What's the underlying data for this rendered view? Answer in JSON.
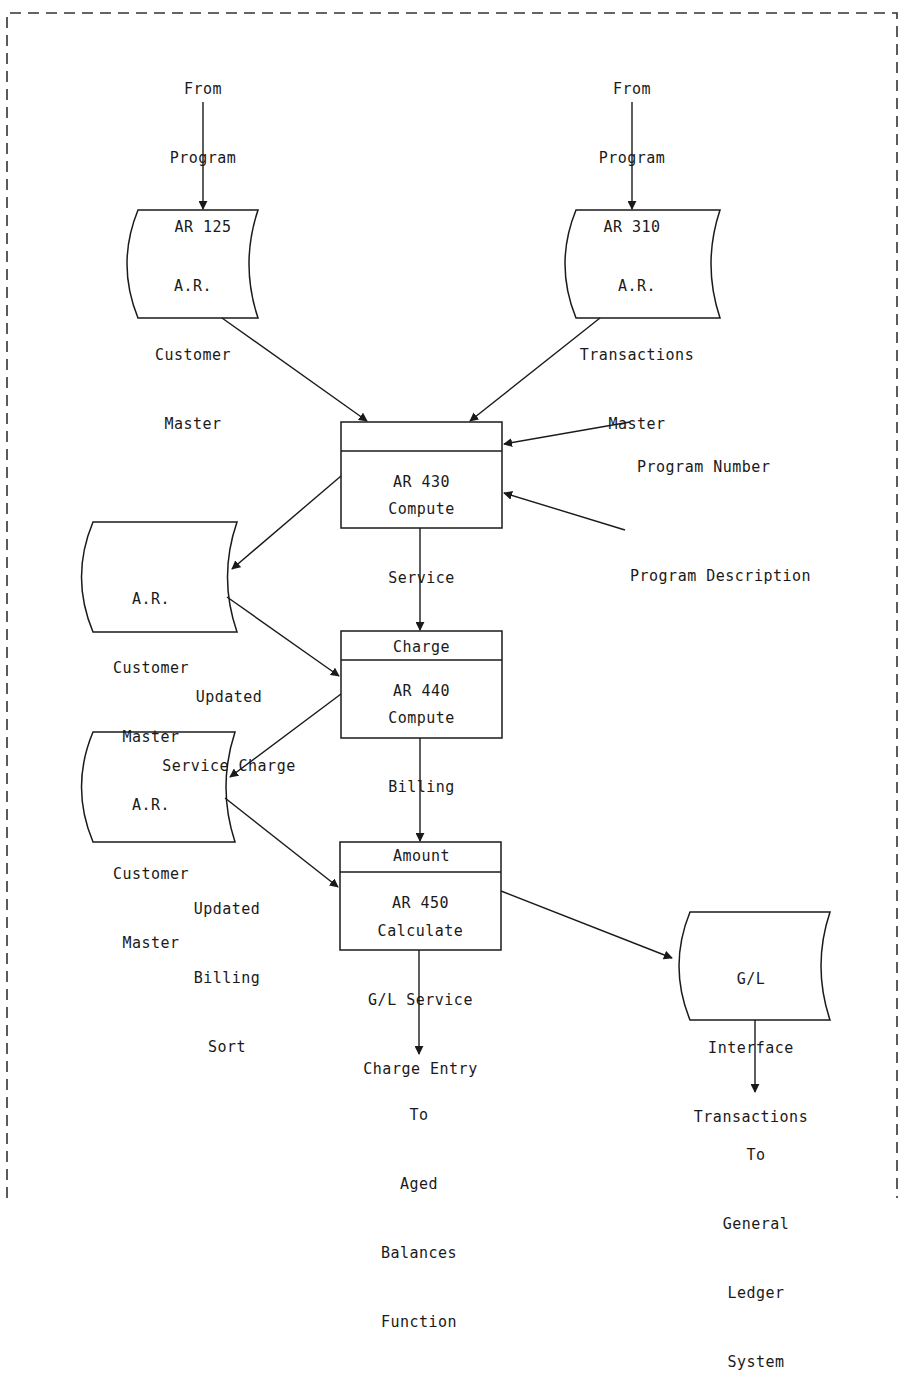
{
  "diagram": {
    "frame": {
      "style": "dashed"
    },
    "sources": {
      "ar125": {
        "lines": [
          "From",
          "Program",
          "AR 125"
        ]
      },
      "ar310": {
        "lines": [
          "From",
          "Program",
          "AR 310"
        ]
      }
    },
    "storage": {
      "customer_master_1": {
        "lines": [
          "A.R.",
          "Customer",
          "Master"
        ]
      },
      "transactions_master": {
        "lines": [
          "A.R.",
          "Transactions",
          "Master"
        ]
      },
      "customer_master_2": {
        "lines": [
          "A.R.",
          "Customer",
          "Master"
        ]
      },
      "customer_master_3": {
        "lines": [
          "A.R.",
          "Customer",
          "Master"
        ]
      },
      "gl_interface": {
        "lines": [
          "G/L",
          "Interface",
          "Transactions"
        ]
      }
    },
    "processes": {
      "ar430": {
        "number": "AR 430",
        "lines": [
          "Compute",
          "Service",
          "Charge"
        ]
      },
      "ar440": {
        "number": "AR 440",
        "lines": [
          "Compute",
          "Billing",
          "Amount"
        ]
      },
      "ar450": {
        "number": "AR 450",
        "lines": [
          "Calculate",
          "G/L Service",
          "Charge Entry"
        ]
      }
    },
    "annotations": {
      "program_number": "Program Number",
      "program_description": "Program Description",
      "updated_service_charge": [
        "Updated",
        "Service Charge"
      ],
      "updated_billing_sort": [
        "Updated",
        "Billing",
        "Sort"
      ]
    },
    "destinations": {
      "aged_balances": {
        "lines": [
          "To",
          "Aged",
          "Balances",
          "Function"
        ]
      },
      "general_ledger": {
        "lines": [
          "To",
          "General",
          "Ledger",
          "System"
        ]
      }
    }
  },
  "colors": {
    "ink": "#1a1a1a",
    "background": "#ffffff"
  }
}
